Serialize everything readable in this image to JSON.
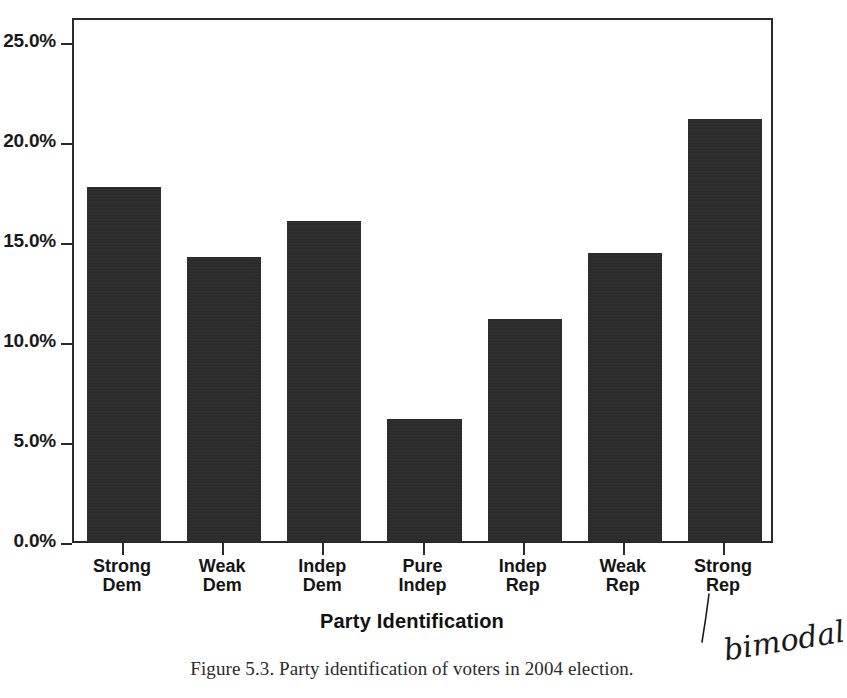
{
  "chart_data": {
    "type": "bar",
    "title": "",
    "xlabel": "Party Identification",
    "ylabel": "",
    "categories": [
      "Strong\nDem",
      "Weak\nDem",
      "Indep\nDem",
      "Pure\nIndep",
      "Indep\nRep",
      "Weak\nRep",
      "Strong\nRep"
    ],
    "values": [
      17.7,
      14.2,
      16.0,
      6.1,
      11.1,
      14.4,
      21.1
    ],
    "ylim": [
      0,
      26.25
    ],
    "yticks": [
      0.0,
      5.0,
      10.0,
      15.0,
      20.0,
      25.0
    ],
    "ytick_labels": [
      "0.0%",
      "5.0%",
      "10.0%",
      "15.0%",
      "20.0%",
      "25.0%"
    ],
    "grid": false,
    "legend": false,
    "bar_color": "#2b2b2b"
  },
  "caption": {
    "text": "Figure 5.3. Party identification of voters in 2004 election."
  },
  "annotation": {
    "handwritten_note": "bimodal"
  }
}
